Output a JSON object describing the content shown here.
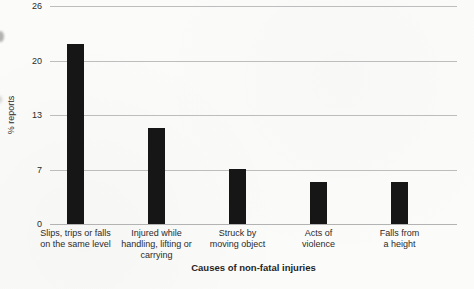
{
  "chart_data": {
    "type": "bar",
    "title": "",
    "xlabel": "Causes of non-fatal injuries",
    "ylabel": "% reports",
    "categories": [
      "Slips, trips or falls on the same level",
      "Injured while handling, lifting or carrying",
      "Struck by moving object",
      "Acts of violence",
      "Falls from a height"
    ],
    "category_lines": [
      [
        "Slips, trips or falls",
        "on the same level"
      ],
      [
        "Injured while",
        "handling, lifting or",
        "carrying"
      ],
      [
        "Struck by",
        "moving object"
      ],
      [
        "Acts of",
        "violence"
      ],
      [
        "Falls from",
        "a height"
      ]
    ],
    "values": [
      21.5,
      11.5,
      6.5,
      5,
      5
    ],
    "ylim": [
      0,
      26
    ],
    "yticks": [
      "0",
      "7",
      "13",
      "20",
      "26"
    ],
    "grid": true,
    "legend": false,
    "bar_color": "#161616",
    "gridline_color": "#bdbdbd"
  }
}
